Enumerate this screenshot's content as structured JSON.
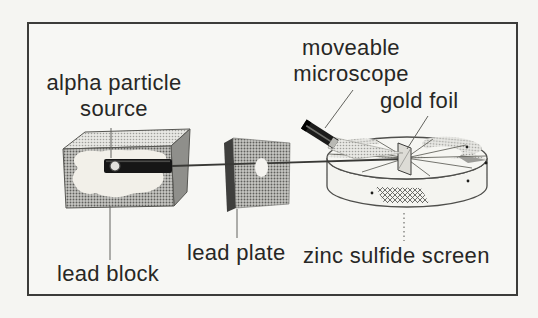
{
  "labels": {
    "alpha_particle_source": "alpha particle source",
    "moveable_microscope": "moveable microscope",
    "gold_foil": "gold foil",
    "lead_plate": "lead plate",
    "lead_block": "lead block",
    "zinc_sulfide_screen": "zinc sulfide screen"
  },
  "colors": {
    "ink": "#2a2a28",
    "halftone_gray": "#8f8f8b",
    "paper": "#f5f5f2",
    "tube_black": "#1b1b1a",
    "frame_border": "#3c3c3a"
  }
}
